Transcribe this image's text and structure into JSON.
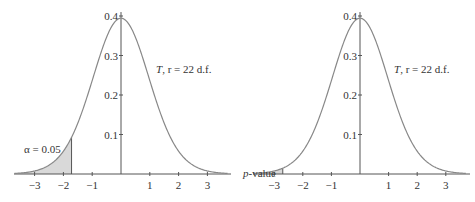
{
  "chart_data": [
    {
      "type": "line",
      "title": "",
      "xlabel": "",
      "ylabel": "",
      "distribution": "Student t",
      "degrees_of_freedom": 22,
      "curve_label": "T, r = 22 d.f.",
      "x_ticks": [
        -3,
        -2,
        -1,
        1,
        2,
        3
      ],
      "x_tick_labels": [
        "−3",
        "−2",
        "−1",
        "1",
        "2",
        "3"
      ],
      "y_ticks": [
        0.1,
        0.2,
        0.3,
        0.4
      ],
      "y_tick_labels": [
        "0.1",
        "0.2",
        "0.3",
        "0.4"
      ],
      "xlim": [
        -3.7,
        3.7
      ],
      "ylim": [
        0,
        0.41
      ],
      "shaded_region": {
        "from": -3.7,
        "to": -1.717,
        "label": "α = 0.05",
        "fill": "#d9d9d9"
      },
      "grid": false,
      "legend": "none"
    },
    {
      "type": "line",
      "title": "",
      "xlabel": "",
      "ylabel": "",
      "distribution": "Student t",
      "degrees_of_freedom": 22,
      "curve_label": "T, r = 22 d.f.",
      "x_ticks": [
        -3,
        -2,
        -1,
        1,
        2,
        3
      ],
      "x_tick_labels": [
        "−3",
        "−2",
        "−1",
        "1",
        "2",
        "3"
      ],
      "y_ticks": [
        0.1,
        0.2,
        0.3,
        0.4
      ],
      "y_tick_labels": [
        "0.1",
        "0.2",
        "0.3",
        "0.4"
      ],
      "xlim": [
        -3.7,
        3.7
      ],
      "ylim": [
        0,
        0.41
      ],
      "shaded_region": {
        "from": -3.7,
        "to": -2.7,
        "label": "p-value",
        "fill": "#d9d9d9"
      },
      "grid": false,
      "legend": "none"
    }
  ],
  "panels": [
    {
      "curve_label_main": "T",
      "curve_label_rest": ", r = 22 d.f.",
      "area_label": "α = 0.05"
    },
    {
      "curve_label_main": "T",
      "curve_label_rest": ", r = 22 d.f.",
      "area_label_italic": "p",
      "area_label_rest": "-value"
    }
  ],
  "colors": {
    "curve": "#888888",
    "axis": "#555555",
    "shade": "#d9d9d9",
    "text": "#333333"
  }
}
